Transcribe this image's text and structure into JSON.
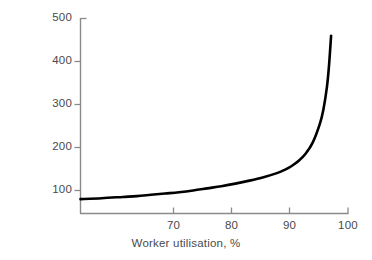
{
  "chart_data": {
    "type": "line",
    "title": "",
    "xlabel": "Worker utilisation, %",
    "ylabel": "Level of WIP",
    "xlim": [
      62,
      100
    ],
    "ylim": [
      0,
      500
    ],
    "xticks": [
      70,
      80,
      90,
      100
    ],
    "xtick_labels": [
      "70",
      "80",
      "90",
      "100"
    ],
    "yticks": [
      100,
      200,
      300,
      400,
      500
    ],
    "ytick_labels": [
      "100",
      "200",
      "300",
      "400",
      "500"
    ],
    "grid": false,
    "legend": false,
    "series": [
      {
        "name": "Level of WIP",
        "color": "#000000",
        "x": [
          62,
          65,
          68,
          70,
          72,
          74,
          76,
          78,
          80,
          82,
          84,
          86,
          88,
          90,
          91,
          92,
          93,
          94,
          95,
          96,
          96.5,
          97,
          97.3,
          97.6
        ],
        "values": [
          80,
          82,
          85,
          87,
          90,
          93,
          96,
          100,
          105,
          110,
          116,
          123,
          131,
          141,
          148,
          157,
          169,
          186,
          212,
          255,
          288,
          340,
          390,
          460
        ]
      }
    ]
  },
  "axes": {
    "line_color": "#8a8a8a",
    "tick_color": "#8a8a8a",
    "label_color": "#4a4a4a"
  },
  "ytick_positions": [
    {
      "label": "500",
      "top": 12,
      "right": 300
    },
    {
      "label": "400",
      "top": 55,
      "right": 300
    },
    {
      "label": "300",
      "top": 98,
      "right": 300
    },
    {
      "label": "200",
      "top": 141,
      "right": 300
    },
    {
      "label": "100",
      "top": 184,
      "right": 300
    }
  ],
  "xtick_positions": [
    {
      "label": "70",
      "left": 160,
      "top": 220
    },
    {
      "label": "80",
      "left": 218,
      "top": 220
    },
    {
      "label": "90",
      "left": 276,
      "top": 220
    },
    {
      "label": "100",
      "left": 333,
      "top": 220
    }
  ]
}
